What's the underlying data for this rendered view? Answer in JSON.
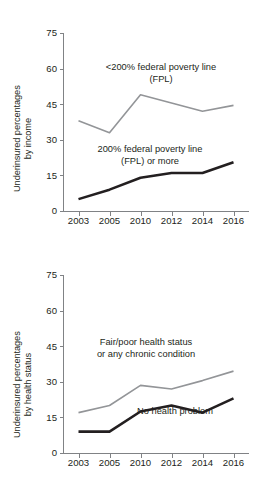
{
  "figure": {
    "background_color": "#ffffff",
    "text_color": "#231f20",
    "axis_color": "#808285"
  },
  "chart_data": [
    {
      "type": "line",
      "panel": "top",
      "title": "",
      "xlabel": "",
      "ylabel": "Underinsured percentages by income",
      "ylabel_line1": "Underinsured percentages",
      "ylabel_line2": "by income",
      "categories": [
        "2003",
        "2005",
        "2010",
        "2012",
        "2014",
        "2016"
      ],
      "yticks": [
        "0",
        "15",
        "30",
        "45",
        "60",
        "75"
      ],
      "ylim": [
        0,
        75
      ],
      "grid": false,
      "legend_position": "inline-annotation",
      "series": [
        {
          "name": "<200% federal poverty line (FPL)",
          "label_line1": "<200% federal poverty line",
          "label_line2": "(FPL)",
          "color": "#939598",
          "width": 1.6,
          "values": [
            38,
            33,
            49,
            45.5,
            42,
            44.5
          ]
        },
        {
          "name": "200% federal poverty line (FPL) or more",
          "label_line1": "200% federal poverty line",
          "label_line2": "(FPL) or more",
          "color": "#231f20",
          "width": 2.6,
          "values": [
            5,
            9,
            14,
            16,
            16,
            20.5
          ]
        }
      ]
    },
    {
      "type": "line",
      "panel": "bottom",
      "title": "",
      "xlabel": "",
      "ylabel": "Underinsured percentages by health status",
      "ylabel_line1": "Underinsured percentages",
      "ylabel_line2": "by health status",
      "categories": [
        "2003",
        "2005",
        "2010",
        "2012",
        "2014",
        "2016"
      ],
      "yticks": [
        "0",
        "15",
        "30",
        "45",
        "60",
        "75"
      ],
      "ylim": [
        0,
        75
      ],
      "grid": false,
      "legend_position": "inline-annotation",
      "series": [
        {
          "name": "Fair/poor health status or any chronic condition",
          "label_line1": "Fair/poor health status",
          "label_line2": "or any chronic condition",
          "color": "#939598",
          "width": 1.6,
          "values": [
            17,
            20,
            28.5,
            27,
            30.5,
            34.5
          ]
        },
        {
          "name": "No health problem",
          "label_line1": "No health problem",
          "label_line2": "",
          "color": "#231f20",
          "width": 2.6,
          "values": [
            9,
            9,
            17.5,
            20,
            17,
            23
          ]
        }
      ]
    }
  ]
}
